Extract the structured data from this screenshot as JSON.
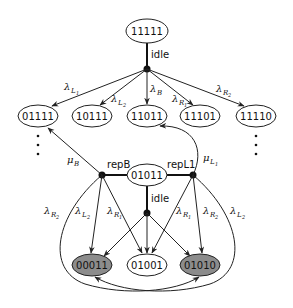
{
  "diagram": {
    "colors": {
      "line": "#222222",
      "node_fill": "#ffffff",
      "absorbing_fill": "#8c8c8c",
      "dot": "#111111"
    },
    "nodes": [
      {
        "id": "11111",
        "label": "11111",
        "cx": 147,
        "cy": 31,
        "shaded": false
      },
      {
        "id": "01111",
        "label": "01111",
        "cx": 38,
        "cy": 116,
        "shaded": false
      },
      {
        "id": "10111",
        "label": "10111",
        "cx": 92,
        "cy": 116,
        "shaded": false
      },
      {
        "id": "11011",
        "label": "11011",
        "cx": 147,
        "cy": 116,
        "shaded": false
      },
      {
        "id": "11101",
        "label": "11101",
        "cx": 200,
        "cy": 116,
        "shaded": false
      },
      {
        "id": "11110",
        "label": "11110",
        "cx": 256,
        "cy": 116,
        "shaded": false
      },
      {
        "id": "01011",
        "label": "01011",
        "cx": 147,
        "cy": 175,
        "shaded": false
      },
      {
        "id": "00011",
        "label": "00011",
        "cx": 92,
        "cy": 265,
        "shaded": true
      },
      {
        "id": "01001",
        "label": "01001",
        "cx": 147,
        "cy": 265,
        "shaded": false
      },
      {
        "id": "01010",
        "label": "01010",
        "cx": 200,
        "cy": 265,
        "shaded": true
      }
    ],
    "action_labels": {
      "idle_top": "idle",
      "repB": "repB",
      "repL1": "repL1",
      "idle_mid": "idle"
    },
    "rate_labels": {
      "lambda": "λ",
      "mu": "μ",
      "top": [
        {
          "base": "λ",
          "sub": "L",
          "subsub": "1"
        },
        {
          "base": "λ",
          "sub": "L",
          "subsub": "2"
        },
        {
          "base": "λ",
          "sub": "B",
          "subsub": ""
        },
        {
          "base": "λ",
          "sub": "R",
          "subsub": "1"
        },
        {
          "base": "λ",
          "sub": "R",
          "subsub": "2"
        }
      ],
      "muB": {
        "base": "μ",
        "sub": "B",
        "subsub": ""
      },
      "muL1": {
        "base": "μ",
        "sub": "L",
        "subsub": "1"
      },
      "left": [
        {
          "base": "λ",
          "sub": "R",
          "subsub": "2"
        },
        {
          "base": "λ",
          "sub": "L",
          "subsub": "2"
        },
        {
          "base": "λ",
          "sub": "R",
          "subsub": "1"
        }
      ],
      "right": [
        {
          "base": "λ",
          "sub": "R",
          "subsub": "1"
        },
        {
          "base": "λ",
          "sub": "R",
          "subsub": "2"
        },
        {
          "base": "λ",
          "sub": "L",
          "subsub": "2"
        }
      ]
    },
    "ellipsis": "⋮"
  }
}
